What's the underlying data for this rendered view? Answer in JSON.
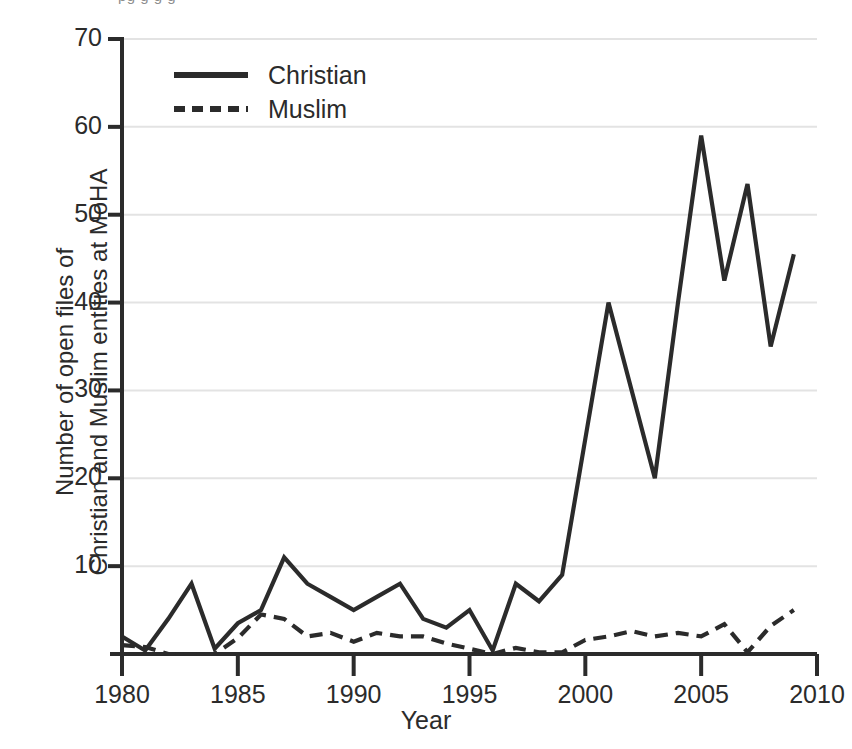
{
  "figure": {
    "xaxis_title": "Year",
    "yaxis_title_line1": "Number of open files of",
    "yaxis_title_line2": "Christian and Muslim entities at MoHA",
    "crop_artifact_text": "pg g g g"
  },
  "legend": {
    "entries": [
      {
        "label": "Christian",
        "style": "solid",
        "color": "#2b2b2b"
      },
      {
        "label": "Muslim",
        "style": "dashed",
        "color": "#2b2b2b"
      }
    ]
  },
  "axes": {
    "x_ticks": [
      "1980",
      "1985",
      "1990",
      "1995",
      "2000",
      "2005",
      "2010"
    ],
    "x_tick_values": [
      1980,
      1985,
      1990,
      1995,
      2000,
      2005,
      2010
    ],
    "y_ticks": [
      "0",
      "10",
      "20",
      "30",
      "40",
      "50",
      "60",
      "70"
    ],
    "y_tick_values": [
      0,
      10,
      20,
      30,
      40,
      50,
      60,
      70
    ],
    "y_tick_labels_shown": [
      "10",
      "20",
      "30",
      "40",
      "50",
      "60",
      "70"
    ],
    "xlim": [
      1980,
      2010
    ],
    "ylim": [
      0,
      70
    ],
    "grid": "horizontal-light"
  },
  "chart_data": {
    "type": "line",
    "title": "",
    "xlabel": "Year",
    "ylabel": "Number of open files of Christian and Muslim entities at MoHA",
    "xlim": [
      1980,
      2010
    ],
    "ylim": [
      0,
      70
    ],
    "grid": true,
    "legend_position": "upper-left-inside",
    "x": [
      1980,
      1981,
      1982,
      1983,
      1984,
      1985,
      1986,
      1987,
      1988,
      1989,
      1990,
      1991,
      1992,
      1993,
      1994,
      1995,
      1996,
      1997,
      1998,
      1999,
      2000,
      2001,
      2002,
      2003,
      2004,
      2005,
      2006,
      2007,
      2008,
      2009
    ],
    "series": [
      {
        "name": "Christian",
        "style": "solid",
        "color": "#2b2b2b",
        "values": [
          2,
          0.4,
          4,
          8,
          0.6,
          3.5,
          5,
          11,
          8,
          6.5,
          5,
          6.5,
          8,
          4,
          3,
          5,
          0.4,
          8,
          6,
          9,
          24.5,
          40,
          30,
          20,
          40,
          59,
          42.5,
          53.5,
          35,
          45.5
        ]
      },
      {
        "name": "Muslim",
        "style": "dashed",
        "color": "#2b2b2b",
        "values": [
          1,
          0.8,
          0,
          0,
          0,
          1.8,
          4.5,
          4,
          2,
          2.4,
          1.4,
          2.4,
          2,
          2,
          1.2,
          0.6,
          0,
          0.7,
          0.2,
          0.2,
          1.6,
          2,
          2.6,
          2,
          2.4,
          2,
          3.4,
          0.2,
          3.2,
          5
        ]
      }
    ]
  },
  "geometry": {
    "plot_left": 122,
    "plot_right": 817,
    "plot_bottom": 654,
    "plot_top": 39
  }
}
